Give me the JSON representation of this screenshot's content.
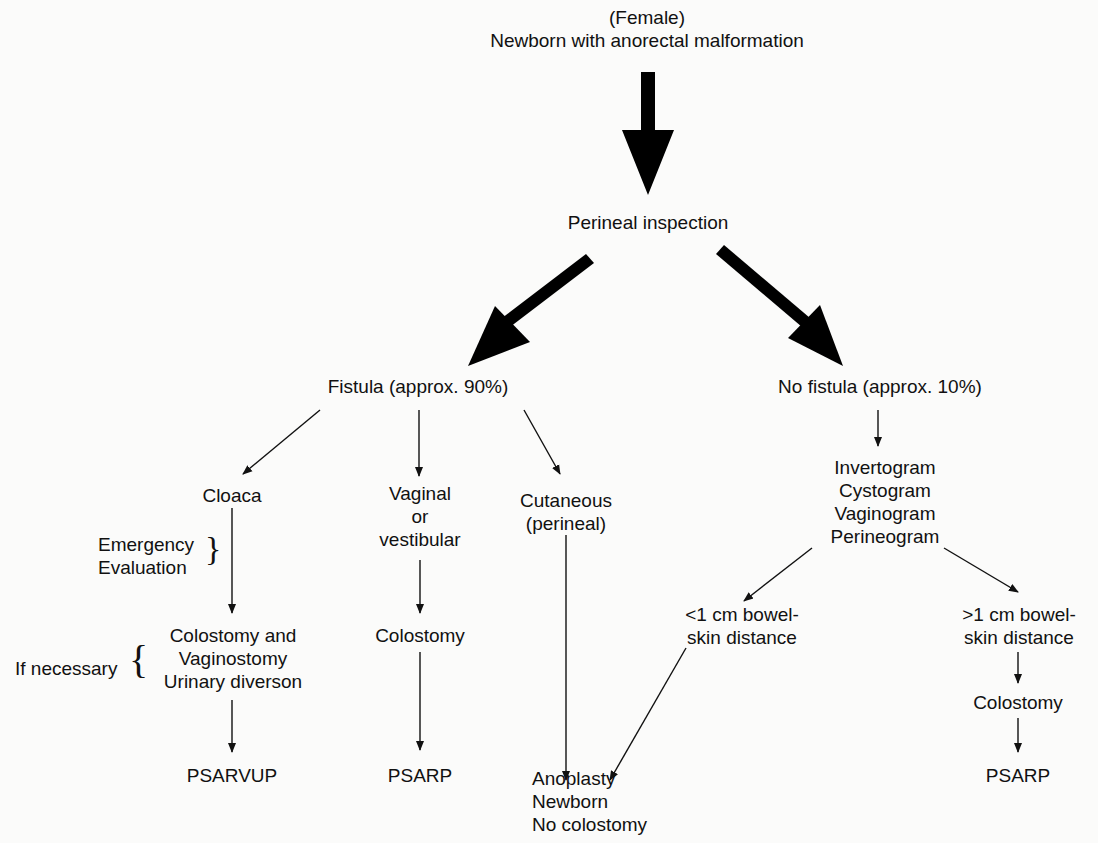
{
  "diagram": {
    "title_lines": [
      "(Female)",
      "Newborn with anorectal malformation"
    ],
    "nodes": {
      "inspection": "Perineal inspection",
      "fistula": "Fistula (approx. 90%)",
      "no_fistula": "No fistula (approx. 10%)",
      "cloaca": "Cloaca",
      "vaginal": [
        "Vaginal",
        "or",
        "vestibular"
      ],
      "cutaneous": [
        "Cutaneous",
        "(perineal)"
      ],
      "imaging": [
        "Invertogram",
        "Cystogram",
        "Vaginogram",
        "Perineogram"
      ],
      "lt1cm": [
        "<1 cm bowel-",
        "skin distance"
      ],
      "gt1cm": [
        ">1 cm bowel-",
        "skin distance"
      ],
      "colostomy_vag_urinary": [
        "Colostomy and",
        "Vaginostomy",
        "Urinary diverson"
      ],
      "colostomy_vaginal": "Colostomy",
      "colostomy_gt1": "Colostomy",
      "psarvup": "PSARVUP",
      "psarp_vaginal": "PSARP",
      "psarp_gt1": "PSARP",
      "anoplasty": [
        "Anoplasty",
        "Newborn",
        "No colostomy"
      ]
    },
    "annotations": {
      "emergency": [
        "Emergency",
        "Evaluation"
      ],
      "if_necessary": "If necessary"
    }
  }
}
